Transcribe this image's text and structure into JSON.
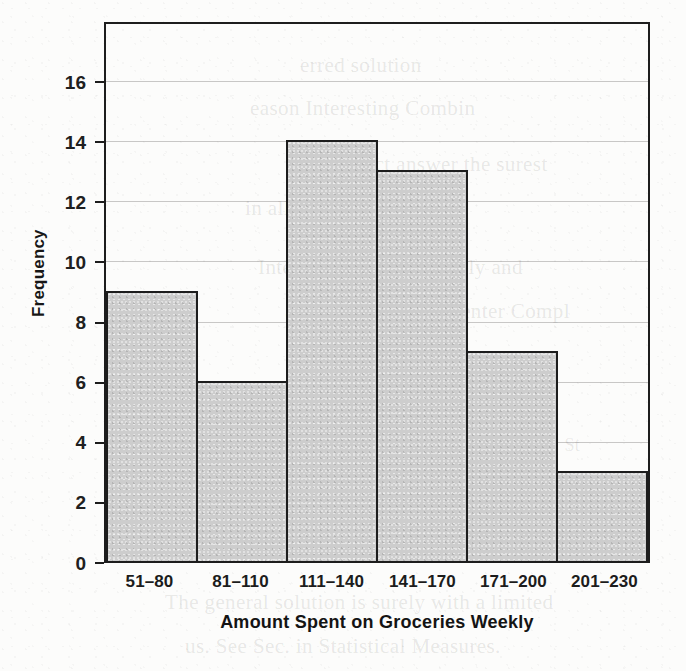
{
  "chart_data": {
    "type": "bar",
    "title": "",
    "subtitle": "",
    "xlabel": "Amount Spent on Groceries Weekly",
    "ylabel": "Frequency",
    "categories": [
      "51–80",
      "81–110",
      "111–140",
      "141–170",
      "171–200",
      "201–230"
    ],
    "values": [
      9,
      6,
      14,
      13,
      7,
      3
    ],
    "series": [
      {
        "name": "Frequency",
        "values": [
          9,
          6,
          14,
          13,
          7,
          3
        ]
      }
    ],
    "ylim": [
      0,
      18
    ],
    "xlim_note": "six contiguous equal-width bins, no gaps (histogram)",
    "y_ticks": [
      0,
      2,
      4,
      6,
      8,
      10,
      12,
      14,
      16
    ],
    "y_tick_labels": [
      "0",
      "2",
      "4",
      "6",
      "8",
      "10",
      "12",
      "14",
      "16"
    ],
    "grid": "horizontal-gridlines-at-y-ticks",
    "legend": "none",
    "legend_position": "none",
    "bar_fill_color": "#cdcdcd",
    "bar_edge_color": "#1d1d1d",
    "axis_color": "#1d1d1d",
    "gridline_color": "#5a5856",
    "background_color": "#fcfcfb",
    "annotations": []
  },
  "figure": {
    "name": "histogram",
    "axis_frame": "full box (left, right, top, bottom spines)"
  },
  "page": {
    "ghost_text": [
      "erred solution",
      "eason Interesting Combin",
      "The correct answer  the surest",
      "in all things simple",
      "Interesting  i.e.  Frequently and",
      "as the Conceptual Center  Compl",
      "A",
      "ason, St",
      "The general solution is surely with a limited",
      "us. See Sec. in Statistical Measures."
    ]
  }
}
